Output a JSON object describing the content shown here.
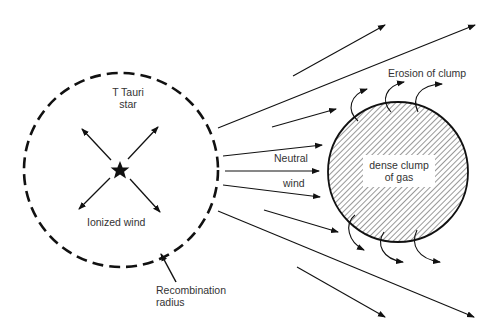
{
  "diagram": {
    "star_label": "T Tauri\nstar",
    "star_label_line1": "T Tauri",
    "star_label_line2": "star",
    "ionized_wind_label": "Ionized wind",
    "recombination_label_line1": "Recombination",
    "recombination_label_line2": "radius",
    "neutral_label": "Neutral",
    "wind_label": "wind",
    "erosion_label": "Erosion of clump",
    "clump_label_line1": "dense clump",
    "clump_label_line2": "of gas",
    "icons": {
      "star": "star-icon",
      "arrow": "arrow-icon"
    },
    "colors": {
      "line": "#111111",
      "text": "#333333",
      "background": "#ffffff"
    }
  }
}
